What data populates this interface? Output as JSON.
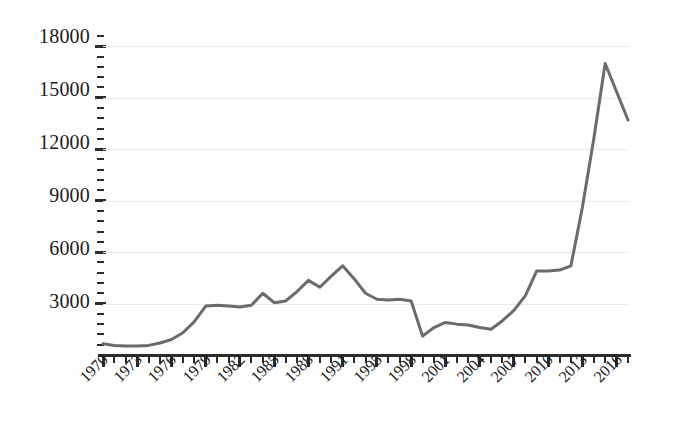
{
  "chart_data": {
    "type": "line",
    "title": "",
    "subtitle": "",
    "xlabel": "",
    "ylabel": "",
    "xlim": [
      1970,
      2017
    ],
    "ylim": [
      0,
      18600
    ],
    "grid": true,
    "legend": null,
    "legend_position": "none",
    "line_color": "#6b6b6b",
    "grid_color": "#e9e9e9",
    "axis_color": "#2c2c2c",
    "text_color": "#1b1b1b",
    "y_tick_labels": [
      "18000",
      "15000",
      "12000",
      "9000",
      "6000",
      "3000"
    ],
    "y_tick_values": [
      18000,
      15000,
      12000,
      9000,
      6000,
      3000
    ],
    "y_minor_interval": 600,
    "x_tick_labels": [
      "1970",
      "1973",
      "1976",
      "1979",
      "1982",
      "1985",
      "1988",
      "1991",
      "1995",
      "1998",
      "2001",
      "2004",
      "2007",
      "2010",
      "2013",
      "2016"
    ],
    "x_tick_label_rotation": -45,
    "x_label_interval_years": 3,
    "x": [
      1970,
      1971,
      1972,
      1973,
      1974,
      1975,
      1976,
      1977,
      1978,
      1979,
      1980,
      1981,
      1982,
      1983,
      1984,
      1985,
      1986,
      1987,
      1988,
      1989,
      1990,
      1991,
      1992,
      1993,
      1994,
      1995,
      1996,
      1997,
      1998,
      1999,
      2000,
      2001,
      2002,
      2003,
      2004,
      2005,
      2006,
      2007,
      2008,
      2009,
      2010,
      2011,
      2012,
      2013,
      2014,
      2015,
      2016
    ],
    "values": [
      650,
      560,
      520,
      520,
      560,
      700,
      900,
      1300,
      1950,
      2850,
      2900,
      2850,
      2800,
      2900,
      3600,
      3050,
      3150,
      3700,
      4350,
      3950,
      4600,
      5200,
      4450,
      3600,
      3250,
      3200,
      3250,
      3150,
      1100,
      1600,
      1900,
      1800,
      1750,
      1600,
      1500,
      2000,
      2600,
      3450,
      4900,
      4900,
      4950,
      5200,
      8600,
      12600,
      17000,
      15350,
      13700
    ]
  }
}
